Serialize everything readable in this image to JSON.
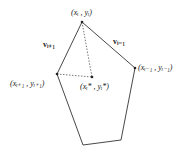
{
  "diagram": {
    "vertices": [
      {
        "id": "vi",
        "x": 82,
        "y": 22,
        "label": "(xᵢ , yᵢ)"
      },
      {
        "id": "vi_minus_1",
        "x": 135,
        "y": 68,
        "label": "(xᵢ₋₁ , yᵢ₋₁)"
      },
      {
        "id": "vi_plus_1",
        "x": 57,
        "y": 74,
        "label": "(xᵢ₊₁ , yᵢ₊₁)"
      },
      {
        "id": "b1",
        "x": 83,
        "y": 145
      },
      {
        "id": "b2",
        "x": 121,
        "y": 140
      }
    ],
    "centroid": {
      "x": 92,
      "y": 77,
      "label": "(xᵢ* , yᵢ*)"
    },
    "edge_labels": {
      "v_plus": "vᵢ₊₁",
      "v_minus": "vᵢ₋₁"
    },
    "colors": {
      "line": "#333333",
      "dotted": "#555555"
    }
  }
}
